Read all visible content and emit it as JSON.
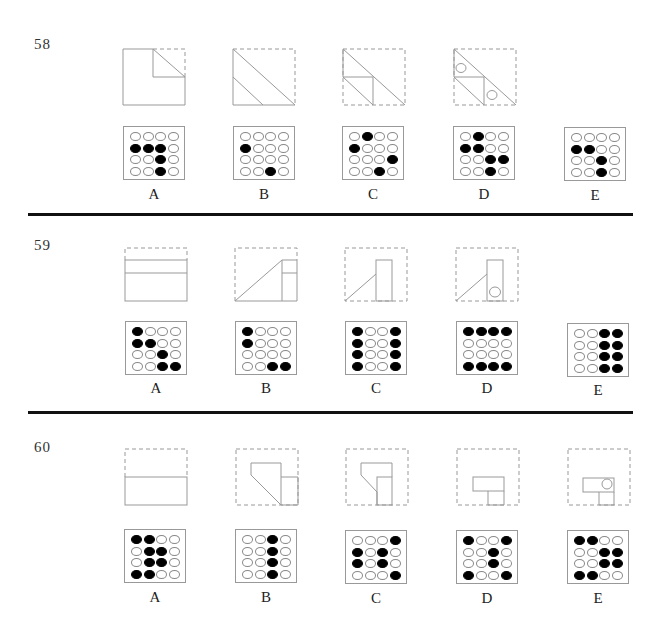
{
  "questions": [
    {
      "number": "58",
      "options": [
        {
          "label": "A",
          "grid": [
            [
              0,
              0,
              0,
              0
            ],
            [
              1,
              1,
              1,
              0
            ],
            [
              0,
              0,
              1,
              0
            ],
            [
              0,
              0,
              1,
              0
            ]
          ]
        },
        {
          "label": "B",
          "grid": [
            [
              0,
              0,
              0,
              0
            ],
            [
              1,
              0,
              0,
              0
            ],
            [
              0,
              0,
              0,
              0
            ],
            [
              0,
              0,
              1,
              0
            ]
          ]
        },
        {
          "label": "C",
          "grid": [
            [
              0,
              1,
              0,
              0
            ],
            [
              1,
              0,
              0,
              0
            ],
            [
              0,
              0,
              0,
              1
            ],
            [
              0,
              0,
              1,
              0
            ]
          ]
        },
        {
          "label": "D",
          "grid": [
            [
              0,
              1,
              0,
              0
            ],
            [
              1,
              1,
              0,
              0
            ],
            [
              0,
              0,
              1,
              1
            ],
            [
              0,
              0,
              1,
              0
            ]
          ]
        },
        {
          "label": "E",
          "grid": [
            [
              0,
              0,
              0,
              0
            ],
            [
              1,
              1,
              0,
              0
            ],
            [
              0,
              0,
              1,
              0
            ],
            [
              0,
              0,
              1,
              0
            ]
          ]
        }
      ],
      "fold_steps": [
        "corner-fold",
        "diagonal-fold",
        "second-fold",
        "punched-holes"
      ]
    },
    {
      "number": "59",
      "options": [
        {
          "label": "A",
          "grid": [
            [
              1,
              0,
              0,
              0
            ],
            [
              1,
              1,
              0,
              0
            ],
            [
              0,
              0,
              1,
              0
            ],
            [
              0,
              0,
              1,
              1
            ]
          ]
        },
        {
          "label": "B",
          "grid": [
            [
              1,
              0,
              0,
              0
            ],
            [
              1,
              0,
              0,
              0
            ],
            [
              0,
              0,
              0,
              0
            ],
            [
              0,
              0,
              1,
              1
            ]
          ]
        },
        {
          "label": "C",
          "grid": [
            [
              1,
              0,
              0,
              1
            ],
            [
              1,
              0,
              0,
              1
            ],
            [
              1,
              0,
              0,
              1
            ],
            [
              1,
              0,
              0,
              1
            ]
          ]
        },
        {
          "label": "D",
          "grid": [
            [
              1,
              1,
              1,
              1
            ],
            [
              0,
              0,
              0,
              0
            ],
            [
              0,
              0,
              0,
              0
            ],
            [
              1,
              1,
              1,
              1
            ]
          ]
        },
        {
          "label": "E",
          "grid": [
            [
              0,
              0,
              1,
              1
            ],
            [
              0,
              0,
              1,
              1
            ],
            [
              0,
              0,
              1,
              1
            ],
            [
              0,
              0,
              1,
              1
            ]
          ]
        }
      ],
      "fold_steps": [
        "top-fold",
        "diagonal-side-fold",
        "column-fold",
        "punched-hole"
      ]
    },
    {
      "number": "60",
      "options": [
        {
          "label": "A",
          "grid": [
            [
              1,
              1,
              0,
              0
            ],
            [
              0,
              1,
              1,
              0
            ],
            [
              0,
              1,
              1,
              0
            ],
            [
              1,
              1,
              0,
              0
            ]
          ]
        },
        {
          "label": "B",
          "grid": [
            [
              0,
              0,
              1,
              0
            ],
            [
              0,
              0,
              1,
              0
            ],
            [
              0,
              0,
              1,
              0
            ],
            [
              0,
              0,
              1,
              0
            ]
          ]
        },
        {
          "label": "C",
          "grid": [
            [
              0,
              0,
              0,
              1
            ],
            [
              1,
              0,
              1,
              0
            ],
            [
              1,
              0,
              1,
              0
            ],
            [
              0,
              0,
              0,
              1
            ]
          ]
        },
        {
          "label": "D",
          "grid": [
            [
              1,
              0,
              0,
              1
            ],
            [
              0,
              0,
              1,
              0
            ],
            [
              0,
              0,
              1,
              0
            ],
            [
              1,
              0,
              0,
              1
            ]
          ]
        },
        {
          "label": "E",
          "grid": [
            [
              1,
              1,
              0,
              0
            ],
            [
              0,
              0,
              1,
              1
            ],
            [
              0,
              0,
              1,
              1
            ],
            [
              1,
              1,
              0,
              0
            ]
          ]
        }
      ],
      "fold_steps": [
        "half-fold",
        "angled-fold",
        "column-fold",
        "t-fold",
        "punched-hole"
      ]
    }
  ]
}
